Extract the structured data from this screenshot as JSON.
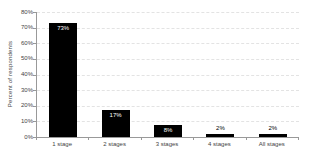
{
  "chart_data": {
    "type": "bar",
    "categories": [
      "1 stage",
      "2 stages",
      "3 stages",
      "4 stages",
      "All stages"
    ],
    "values": [
      73,
      17,
      8,
      2,
      2
    ],
    "value_labels": [
      "73%",
      "17%",
      "8%",
      "2%",
      "2%"
    ],
    "title": "",
    "xlabel": "",
    "ylabel": "Percent of respondents",
    "ylim": [
      0,
      80
    ],
    "ytick_step": 10,
    "ytick_labels": [
      "0%",
      "10%",
      "20%",
      "30%",
      "40%",
      "50%",
      "60%",
      "70%",
      "80%"
    ],
    "grid": "horizontal-dashed",
    "legend": "none",
    "bar_color": "#000000",
    "label_inside_color": "#ffffff",
    "label_outside_color": "#000000",
    "axis_color": "#999999",
    "text_color": "#444444"
  }
}
